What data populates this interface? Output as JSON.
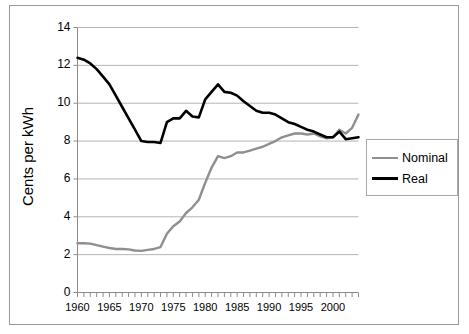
{
  "chart_data": {
    "type": "line",
    "title": "",
    "xlabel": "",
    "ylabel": "Cents per kWh",
    "xlim": [
      1960,
      2004
    ],
    "ylim": [
      0,
      14
    ],
    "ytick_labels": [
      "0",
      "2",
      "4",
      "6",
      "8",
      "10",
      "12",
      "14"
    ],
    "ytick_values": [
      0,
      2,
      4,
      6,
      8,
      10,
      12,
      14
    ],
    "xtick_labels": [
      "1960",
      "1965",
      "1970",
      "1975",
      "1980",
      "1985",
      "1990",
      "1995",
      "2000"
    ],
    "xtick_values": [
      1960,
      1965,
      1970,
      1975,
      1980,
      1985,
      1990,
      1995,
      2000
    ],
    "minor_xticks": "every year 1960-2004",
    "grid": "horizontal",
    "legend_position": "right",
    "x": [
      1960,
      1961,
      1962,
      1963,
      1964,
      1965,
      1966,
      1967,
      1968,
      1969,
      1970,
      1971,
      1972,
      1973,
      1974,
      1975,
      1976,
      1977,
      1978,
      1979,
      1980,
      1981,
      1982,
      1983,
      1984,
      1985,
      1986,
      1987,
      1988,
      1989,
      1990,
      1991,
      1992,
      1993,
      1994,
      1995,
      1996,
      1997,
      1998,
      1999,
      2000,
      2001,
      2002,
      2003,
      2004
    ],
    "series": [
      {
        "name": "Nominal",
        "color": "#8f8f8f",
        "values": [
          2.6,
          2.6,
          2.58,
          2.5,
          2.42,
          2.35,
          2.3,
          2.3,
          2.28,
          2.22,
          2.2,
          2.25,
          2.3,
          2.4,
          3.1,
          3.5,
          3.75,
          4.2,
          4.5,
          4.9,
          5.8,
          6.6,
          7.2,
          7.1,
          7.2,
          7.4,
          7.4,
          7.5,
          7.6,
          7.7,
          7.85,
          8.0,
          8.2,
          8.3,
          8.4,
          8.4,
          8.35,
          8.4,
          8.25,
          8.15,
          8.2,
          8.6,
          8.4,
          8.7,
          9.4
        ]
      },
      {
        "name": "Real",
        "color": "#000000",
        "values": [
          12.4,
          12.3,
          12.1,
          11.8,
          11.4,
          11.0,
          10.4,
          9.8,
          9.2,
          8.6,
          8.0,
          7.95,
          7.95,
          7.9,
          9.0,
          9.2,
          9.2,
          9.6,
          9.3,
          9.25,
          10.2,
          10.6,
          11.0,
          10.6,
          10.55,
          10.4,
          10.1,
          9.85,
          9.6,
          9.5,
          9.5,
          9.4,
          9.2,
          9.0,
          8.9,
          8.75,
          8.6,
          8.5,
          8.35,
          8.2,
          8.2,
          8.5,
          8.1,
          8.15,
          8.2
        ]
      }
    ]
  },
  "legend": {
    "items": [
      {
        "label": "Nominal",
        "color": "#8f8f8f",
        "thickness": 2
      },
      {
        "label": "Real",
        "color": "#000000",
        "thickness": 3
      }
    ]
  },
  "axis": {
    "y_title": "Cents per kWh"
  }
}
